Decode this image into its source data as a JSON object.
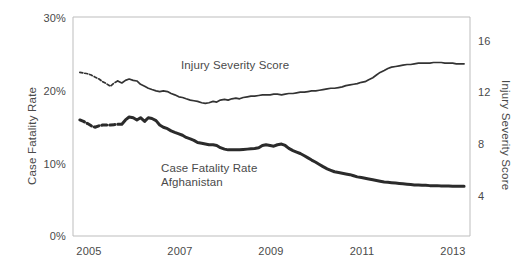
{
  "chart_data": {
    "type": "line",
    "title": "",
    "subtitle": "",
    "grid": false,
    "legend_position": "inline-annotation",
    "xlabel": "",
    "xlim": [
      2004.6,
      2013.3
    ],
    "x_ticks": [
      2005,
      2007,
      2009,
      2011,
      2013
    ],
    "x_tick_labels": [
      "2005",
      "2007",
      "2009",
      "2011",
      "2013"
    ],
    "axes": {
      "left": {
        "label": "Case Fatality Rate",
        "ticks": [
          0,
          10,
          20,
          30
        ],
        "tick_labels": [
          "0%",
          "10%",
          "20%",
          "30%"
        ],
        "ylim": [
          0,
          30
        ],
        "unit": "%"
      },
      "right": {
        "label": "Injury Severity Score",
        "ticks": [
          4,
          8,
          12,
          16
        ],
        "tick_labels": [
          "4",
          "8",
          "12",
          "16"
        ],
        "ylim": [
          1.5,
          18.1
        ],
        "unit": ""
      }
    },
    "annotations": [
      {
        "text": "Injury Severity Score",
        "x": 2007.15,
        "y_left": 23.2
      },
      {
        "text": "Case Fatality Rate",
        "x": 2006.6,
        "y_left": 9.1
      },
      {
        "text": "Afghanistan",
        "x": 2006.6,
        "y_left": 7.4
      }
    ],
    "series": [
      {
        "name": "Injury Severity Score",
        "axis": "right",
        "color": "#333333",
        "width": 1.7,
        "dashed_prefix_points": 11,
        "x": [
          2004.75,
          2004.83,
          2004.92,
          2005.0,
          2005.08,
          2005.17,
          2005.25,
          2005.33,
          2005.42,
          2005.5,
          2005.58,
          2005.67,
          2005.75,
          2005.83,
          2005.92,
          2006.0,
          2006.08,
          2006.17,
          2006.25,
          2006.33,
          2006.42,
          2006.5,
          2006.58,
          2006.67,
          2006.75,
          2006.83,
          2006.92,
          2007.0,
          2007.08,
          2007.17,
          2007.25,
          2007.33,
          2007.42,
          2007.5,
          2007.58,
          2007.67,
          2007.75,
          2007.83,
          2007.92,
          2008.0,
          2008.08,
          2008.17,
          2008.25,
          2008.33,
          2008.42,
          2008.5,
          2008.58,
          2008.67,
          2008.75,
          2008.83,
          2008.92,
          2009.0,
          2009.08,
          2009.17,
          2009.25,
          2009.33,
          2009.42,
          2009.5,
          2009.58,
          2009.67,
          2009.75,
          2009.83,
          2009.92,
          2010.0,
          2010.08,
          2010.17,
          2010.25,
          2010.33,
          2010.42,
          2010.5,
          2010.58,
          2010.67,
          2010.75,
          2010.83,
          2010.92,
          2011.0,
          2011.08,
          2011.17,
          2011.25,
          2011.33,
          2011.42,
          2011.5,
          2011.58,
          2011.67,
          2011.75,
          2011.83,
          2011.92,
          2012.0,
          2012.08,
          2012.17,
          2012.25,
          2012.33,
          2012.42,
          2012.5,
          2012.58,
          2012.67,
          2012.75,
          2012.83,
          2012.92,
          2013.0,
          2013.08,
          2013.17
        ],
        "values": [
          13.9,
          13.85,
          13.8,
          13.7,
          13.55,
          13.4,
          13.2,
          13.05,
          12.85,
          13.1,
          13.25,
          13.1,
          13.3,
          13.4,
          13.3,
          13.25,
          13.0,
          12.85,
          12.7,
          12.6,
          12.5,
          12.45,
          12.5,
          12.45,
          12.3,
          12.2,
          12.05,
          12.0,
          11.9,
          11.8,
          11.75,
          11.7,
          11.6,
          11.55,
          11.6,
          11.7,
          11.65,
          11.8,
          11.85,
          11.8,
          11.9,
          11.95,
          11.9,
          12.0,
          12.05,
          12.1,
          12.1,
          12.15,
          12.2,
          12.2,
          12.2,
          12.25,
          12.25,
          12.2,
          12.25,
          12.3,
          12.3,
          12.35,
          12.4,
          12.4,
          12.45,
          12.5,
          12.5,
          12.55,
          12.6,
          12.65,
          12.7,
          12.7,
          12.75,
          12.8,
          12.9,
          12.95,
          13.0,
          13.05,
          13.15,
          13.2,
          13.35,
          13.5,
          13.7,
          13.9,
          14.05,
          14.2,
          14.3,
          14.35,
          14.4,
          14.45,
          14.5,
          14.5,
          14.55,
          14.6,
          14.6,
          14.6,
          14.6,
          14.65,
          14.65,
          14.65,
          14.6,
          14.6,
          14.6,
          14.55,
          14.55,
          14.55
        ]
      },
      {
        "name": "Case Fatality Rate Afghanistan",
        "axis": "left",
        "color": "#2b2b2b",
        "width": 3.0,
        "dashed_prefix_points": 11,
        "x": [
          2004.75,
          2004.83,
          2004.92,
          2005.0,
          2005.08,
          2005.17,
          2005.25,
          2005.33,
          2005.42,
          2005.5,
          2005.58,
          2005.67,
          2005.75,
          2005.83,
          2005.92,
          2006.0,
          2006.08,
          2006.17,
          2006.25,
          2006.33,
          2006.42,
          2006.5,
          2006.58,
          2006.67,
          2006.75,
          2006.83,
          2006.92,
          2007.0,
          2007.08,
          2007.17,
          2007.25,
          2007.33,
          2007.42,
          2007.5,
          2007.58,
          2007.67,
          2007.75,
          2007.83,
          2007.92,
          2008.0,
          2008.08,
          2008.17,
          2008.25,
          2008.33,
          2008.42,
          2008.5,
          2008.58,
          2008.67,
          2008.75,
          2008.83,
          2008.92,
          2009.0,
          2009.08,
          2009.17,
          2009.25,
          2009.33,
          2009.42,
          2009.5,
          2009.58,
          2009.67,
          2009.75,
          2009.83,
          2009.92,
          2010.0,
          2010.08,
          2010.17,
          2010.25,
          2010.33,
          2010.42,
          2010.5,
          2010.58,
          2010.67,
          2010.75,
          2010.83,
          2010.92,
          2011.0,
          2011.08,
          2011.17,
          2011.25,
          2011.33,
          2011.42,
          2011.5,
          2011.58,
          2011.67,
          2011.75,
          2011.83,
          2011.92,
          2012.0,
          2012.08,
          2012.17,
          2012.25,
          2012.33,
          2012.42,
          2012.5,
          2012.58,
          2012.67,
          2012.75,
          2012.83,
          2012.92,
          2013.0,
          2013.08,
          2013.17
        ],
        "values": [
          15.9,
          15.7,
          15.4,
          15.1,
          14.9,
          15.1,
          15.2,
          15.2,
          15.2,
          15.25,
          15.3,
          15.3,
          15.9,
          16.3,
          16.2,
          15.9,
          16.2,
          15.7,
          16.2,
          16.1,
          15.8,
          15.2,
          14.9,
          14.7,
          14.4,
          14.2,
          14.0,
          13.8,
          13.5,
          13.3,
          13.1,
          12.8,
          12.7,
          12.6,
          12.5,
          12.5,
          12.4,
          12.1,
          11.9,
          11.8,
          11.8,
          11.8,
          11.8,
          11.85,
          11.9,
          11.95,
          12.0,
          12.1,
          12.4,
          12.5,
          12.4,
          12.3,
          12.5,
          12.6,
          12.4,
          12.0,
          11.7,
          11.5,
          11.3,
          11.0,
          10.7,
          10.4,
          10.1,
          9.8,
          9.5,
          9.2,
          9.0,
          8.8,
          8.7,
          8.6,
          8.5,
          8.4,
          8.25,
          8.1,
          8.0,
          7.9,
          7.8,
          7.7,
          7.6,
          7.5,
          7.4,
          7.35,
          7.3,
          7.25,
          7.2,
          7.15,
          7.1,
          7.05,
          7.0,
          7.0,
          6.95,
          6.95,
          6.9,
          6.9,
          6.9,
          6.85,
          6.85,
          6.85,
          6.8,
          6.8,
          6.8,
          6.8
        ]
      }
    ]
  },
  "plot_frame": {
    "border_color": "#bdbdbd"
  }
}
